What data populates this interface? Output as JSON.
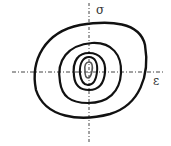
{
  "diagram": {
    "type": "hysteresis-loops",
    "axes": {
      "vertical_label": "σ",
      "horizontal_label": "ε"
    },
    "loop_count": 5,
    "colors": {
      "line": "#111111",
      "axis": "#444444",
      "background": "#ffffff"
    }
  }
}
